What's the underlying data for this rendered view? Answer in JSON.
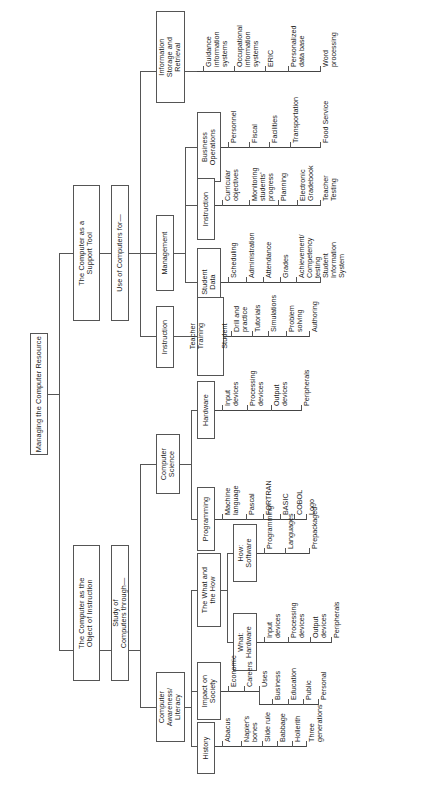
{
  "diagram": {
    "type": "tree",
    "orientation": "rotated-90-ccw",
    "title": "Managing the Computer Resource",
    "root": "Managing the Computer Resource",
    "branches": {
      "object_of_instruction": {
        "label": "The Computer as the\nObject of Instruction",
        "subhead": "Study of\nComputers through—",
        "children": [
          {
            "label": "Computer\nAwareness/\nLiteracy",
            "children": [
              {
                "label": "The What and\nthe How",
                "children": [
                  {
                    "label": "How:\nSoftware",
                    "leaves": [
                      "Programming",
                      "Languages",
                      "Prepackaged"
                    ]
                  },
                  {
                    "label": "What:\nHardware",
                    "leaves": [
                      "Input\ndevices",
                      "Processing\ndevices",
                      "Output\ndevices",
                      "Peripherals"
                    ]
                  }
                ]
              },
              {
                "label": "Impact on\nSociety",
                "leaves": [
                  "Economic",
                  "Careers",
                  "Uses"
                ],
                "sub_leaves": [
                  "Business",
                  "Education",
                  "Public",
                  "Personal"
                ]
              },
              {
                "label": "History",
                "leaves": [
                  "Abacus",
                  "Napier's\nbones",
                  "Slide rule",
                  "Babbage",
                  "Hollerith",
                  "Three\ngenerations"
                ]
              }
            ]
          },
          {
            "label": "Computer\nScience",
            "children": [
              {
                "label": "Hardware",
                "leaves": [
                  "Input\ndevices",
                  "Processing\ndevices",
                  "Output\ndevices",
                  "Peripherals"
                ]
              },
              {
                "label": "Programming",
                "leaves": [
                  "Machine\nlanguage",
                  "Pascal",
                  "FORTRAN",
                  "BASIC",
                  "COBOL",
                  "Logo"
                ]
              }
            ]
          }
        ]
      },
      "support_tool": {
        "label": "The Computer as a\nSupport Tool",
        "subhead": "Use of Computers for—",
        "children": [
          {
            "label": "Instruction",
            "children": [
              {
                "label_a": "Teacher\nTraining",
                "label_b": "Student",
                "leaves": [
                  "Drill and\npractice",
                  "Tutorials",
                  "Simulations",
                  "Problem\nsolving",
                  "Authoring"
                ]
              }
            ]
          },
          {
            "label": "Management",
            "children": [
              {
                "label": "Student\nData",
                "leaves": [
                  "Scheduling",
                  "Administration",
                  "Attendance",
                  "Grades",
                  "Achievement/\nCompetency\ntesting",
                  "Student\nInformation\nSystem"
                ]
              },
              {
                "label": "Instruction",
                "leaves": [
                  "Curricular\nobjectives",
                  "Monitoring\nstudents'\nprogress",
                  "Planning",
                  "Electronic\nGradebook",
                  "Teacher\nTesting"
                ]
              },
              {
                "label": "Business\nOperations",
                "leaves": [
                  "Personnel",
                  "Fiscal",
                  "Facilities",
                  "Transportation",
                  "Food Service"
                ]
              }
            ]
          },
          {
            "label": "Information\nStorage and\nRetrieval",
            "leaves": [
              "Guidance\ninformation\nsystems",
              "Occupational\ninformation\nsystems",
              "ERIC",
              "Personalized\ndata base",
              "Word\nprocessing"
            ]
          }
        ]
      }
    }
  },
  "colors": {
    "line": "#555555",
    "box_border": "#555555",
    "text": "#1a1a1a",
    "background": "#ffffff"
  }
}
